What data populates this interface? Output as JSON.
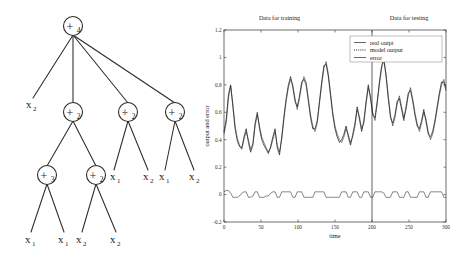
{
  "figure": {
    "caption": "",
    "panels": [
      "expression-tree",
      "output-and-error-plot"
    ]
  },
  "tree": {
    "name": "expression-tree",
    "root_label": "+",
    "nodes": [
      {
        "id": "n0",
        "op": "+",
        "subscript": "4",
        "x": 73,
        "y": 26
      },
      {
        "id": "n1",
        "op": "+",
        "subscript": "2",
        "x": 73,
        "y": 112
      },
      {
        "id": "n2",
        "op": "+",
        "subscript": "2",
        "x": 128,
        "y": 112
      },
      {
        "id": "n3",
        "op": "+",
        "subscript": "2",
        "x": 175,
        "y": 112
      },
      {
        "id": "n4",
        "op": "+",
        "subscript": "3",
        "x": 47,
        "y": 175
      },
      {
        "id": "n5",
        "op": "+",
        "subscript": "2",
        "x": 96,
        "y": 175
      }
    ],
    "leaves": [
      {
        "id": "l0",
        "var": "x",
        "subscript": "2",
        "x": 30,
        "y": 108
      },
      {
        "id": "l1",
        "var": "x",
        "subscript": "1",
        "x": 118,
        "y": 180
      },
      {
        "id": "l2",
        "var": "x",
        "subscript": "2",
        "x": 150,
        "y": 180
      },
      {
        "id": "l3",
        "var": "x",
        "subscript": "1",
        "x": 166,
        "y": 180
      },
      {
        "id": "l4",
        "var": "x",
        "subscript": "2",
        "x": 196,
        "y": 180
      },
      {
        "id": "l5",
        "var": "x",
        "subscript": "1",
        "x": 30,
        "y": 243
      },
      {
        "id": "l6",
        "var": "x",
        "subscript": "1",
        "x": 65,
        "y": 243
      },
      {
        "id": "l7",
        "var": "x",
        "subscript": "2",
        "x": 83,
        "y": 243
      },
      {
        "id": "l8",
        "var": "x",
        "subscript": "2",
        "x": 117,
        "y": 243
      }
    ],
    "edges": [
      {
        "from": "n0",
        "to": "l0"
      },
      {
        "from": "n0",
        "to": "n1"
      },
      {
        "from": "n0",
        "to": "n2"
      },
      {
        "from": "n0",
        "to": "n3"
      },
      {
        "from": "n1",
        "to": "n4"
      },
      {
        "from": "n1",
        "to": "n5"
      },
      {
        "from": "n2",
        "to": "l1"
      },
      {
        "from": "n2",
        "to": "l2"
      },
      {
        "from": "n3",
        "to": "l3"
      },
      {
        "from": "n3",
        "to": "l4"
      },
      {
        "from": "n4",
        "to": "l5"
      },
      {
        "from": "n4",
        "to": "l6"
      },
      {
        "from": "n5",
        "to": "l7"
      },
      {
        "from": "n5",
        "to": "l8"
      }
    ]
  },
  "chart_data": {
    "type": "line",
    "title": "",
    "xlabel": "time",
    "ylabel": "output and error",
    "xlim": [
      0,
      300
    ],
    "ylim": [
      -0.2,
      1.2
    ],
    "xticks": [
      0,
      50,
      100,
      150,
      200,
      250,
      300
    ],
    "xtick_labels": [
      "0",
      "50",
      "100",
      "150",
      "200",
      "250",
      "300"
    ],
    "yticks": [
      -0.2,
      0,
      0.2,
      0.4,
      0.6,
      0.8,
      1,
      1.2
    ],
    "ytick_labels": [
      "-0.2",
      "0",
      "0.2",
      "0.4",
      "0.6",
      "0.8",
      "1",
      "1.2"
    ],
    "grid": false,
    "legend_position": "top-right",
    "annotations": [
      {
        "text": "Data for training",
        "x": 75,
        "y": 1.27
      },
      {
        "text": "Data for testing",
        "x": 250,
        "y": 1.27
      }
    ],
    "split_line_x": 200,
    "legend": [
      {
        "name": "real outpt",
        "style": "solid"
      },
      {
        "name": "model output",
        "style": "dotted"
      },
      {
        "name": "error",
        "style": "solid"
      }
    ],
    "series": [
      {
        "name": "real outpt",
        "style": "solid",
        "x": [
          0,
          3,
          6,
          9,
          12,
          15,
          18,
          21,
          24,
          27,
          30,
          33,
          36,
          39,
          42,
          45,
          48,
          51,
          54,
          57,
          60,
          63,
          66,
          69,
          72,
          75,
          78,
          81,
          84,
          87,
          90,
          93,
          96,
          99,
          102,
          105,
          108,
          111,
          114,
          117,
          120,
          123,
          126,
          129,
          132,
          135,
          138,
          141,
          144,
          147,
          150,
          153,
          156,
          159,
          162,
          165,
          168,
          171,
          174,
          177,
          180,
          183,
          186,
          189,
          192,
          195,
          198,
          201,
          204,
          207,
          210,
          213,
          216,
          219,
          222,
          225,
          228,
          231,
          234,
          237,
          240,
          243,
          246,
          249,
          252,
          255,
          258,
          261,
          264,
          267,
          270,
          273,
          276,
          279,
          282,
          285,
          288,
          291,
          294,
          297,
          300
        ],
        "values": [
          0.44,
          0.52,
          0.7,
          0.79,
          0.66,
          0.5,
          0.41,
          0.36,
          0.33,
          0.4,
          0.46,
          0.4,
          0.33,
          0.37,
          0.5,
          0.58,
          0.5,
          0.42,
          0.38,
          0.34,
          0.31,
          0.34,
          0.4,
          0.46,
          0.36,
          0.31,
          0.4,
          0.55,
          0.68,
          0.78,
          0.84,
          0.8,
          0.7,
          0.62,
          0.7,
          0.8,
          0.86,
          0.82,
          0.7,
          0.58,
          0.5,
          0.46,
          0.52,
          0.66,
          0.8,
          0.92,
          0.97,
          0.88,
          0.74,
          0.6,
          0.5,
          0.44,
          0.4,
          0.38,
          0.42,
          0.48,
          0.44,
          0.38,
          0.42,
          0.5,
          0.62,
          0.57,
          0.48,
          0.52,
          0.66,
          0.78,
          0.72,
          0.6,
          0.54,
          0.66,
          0.8,
          0.92,
          0.98,
          0.88,
          0.72,
          0.58,
          0.5,
          0.56,
          0.66,
          0.72,
          0.64,
          0.56,
          0.62,
          0.72,
          0.78,
          0.7,
          0.6,
          0.52,
          0.46,
          0.52,
          0.6,
          0.55,
          0.46,
          0.4,
          0.44,
          0.52,
          0.62,
          0.72,
          0.8,
          0.84,
          0.78
        ]
      },
      {
        "name": "model output",
        "style": "dotted",
        "x": [
          0,
          3,
          6,
          9,
          12,
          15,
          18,
          21,
          24,
          27,
          30,
          33,
          36,
          39,
          42,
          45,
          48,
          51,
          54,
          57,
          60,
          63,
          66,
          69,
          72,
          75,
          78,
          81,
          84,
          87,
          90,
          93,
          96,
          99,
          102,
          105,
          108,
          111,
          114,
          117,
          120,
          123,
          126,
          129,
          132,
          135,
          138,
          141,
          144,
          147,
          150,
          153,
          156,
          159,
          162,
          165,
          168,
          171,
          174,
          177,
          180,
          183,
          186,
          189,
          192,
          195,
          198,
          201,
          204,
          207,
          210,
          213,
          216,
          219,
          222,
          225,
          228,
          231,
          234,
          237,
          240,
          243,
          246,
          249,
          252,
          255,
          258,
          261,
          264,
          267,
          270,
          273,
          276,
          279,
          282,
          285,
          288,
          291,
          294,
          297,
          300
        ],
        "values": [
          0.46,
          0.55,
          0.73,
          0.8,
          0.64,
          0.48,
          0.39,
          0.35,
          0.34,
          0.42,
          0.48,
          0.38,
          0.31,
          0.36,
          0.52,
          0.6,
          0.48,
          0.4,
          0.36,
          0.33,
          0.3,
          0.35,
          0.42,
          0.48,
          0.34,
          0.29,
          0.42,
          0.57,
          0.7,
          0.8,
          0.86,
          0.78,
          0.68,
          0.64,
          0.72,
          0.82,
          0.84,
          0.8,
          0.68,
          0.56,
          0.48,
          0.48,
          0.54,
          0.68,
          0.82,
          0.94,
          0.95,
          0.86,
          0.72,
          0.58,
          0.48,
          0.42,
          0.38,
          0.4,
          0.44,
          0.5,
          0.42,
          0.36,
          0.44,
          0.52,
          0.64,
          0.55,
          0.46,
          0.54,
          0.68,
          0.8,
          0.7,
          0.58,
          0.56,
          0.68,
          0.82,
          0.94,
          0.99,
          0.86,
          0.7,
          0.56,
          0.52,
          0.58,
          0.68,
          0.7,
          0.62,
          0.54,
          0.64,
          0.74,
          0.76,
          0.68,
          0.58,
          0.5,
          0.48,
          0.54,
          0.62,
          0.53,
          0.44,
          0.42,
          0.46,
          0.54,
          0.64,
          0.74,
          0.82,
          0.82,
          0.76
        ]
      },
      {
        "name": "error",
        "style": "solid",
        "x": [
          0,
          3,
          6,
          9,
          12,
          15,
          18,
          21,
          24,
          27,
          30,
          33,
          36,
          39,
          42,
          45,
          48,
          51,
          54,
          57,
          60,
          63,
          66,
          69,
          72,
          75,
          78,
          81,
          84,
          87,
          90,
          93,
          96,
          99,
          102,
          105,
          108,
          111,
          114,
          117,
          120,
          123,
          126,
          129,
          132,
          135,
          138,
          141,
          144,
          147,
          150,
          153,
          156,
          159,
          162,
          165,
          168,
          171,
          174,
          177,
          180,
          183,
          186,
          189,
          192,
          195,
          198,
          201,
          204,
          207,
          210,
          213,
          216,
          219,
          222,
          225,
          228,
          231,
          234,
          237,
          240,
          243,
          246,
          249,
          252,
          255,
          258,
          261,
          264,
          267,
          270,
          273,
          276,
          279,
          282,
          285,
          288,
          291,
          294,
          297,
          300
        ],
        "values": [
          0.02,
          0.03,
          0.03,
          0.01,
          -0.02,
          -0.02,
          -0.02,
          -0.01,
          0.01,
          0.02,
          0.02,
          -0.02,
          -0.02,
          -0.01,
          0.02,
          0.02,
          -0.02,
          -0.02,
          -0.02,
          -0.01,
          -0.01,
          0.01,
          0.02,
          0.02,
          -0.02,
          -0.02,
          0.02,
          0.02,
          0.02,
          0.02,
          0.02,
          -0.02,
          -0.02,
          0.02,
          0.02,
          0.02,
          -0.02,
          -0.02,
          -0.02,
          -0.02,
          -0.02,
          0.02,
          0.02,
          0.02,
          0.02,
          0.02,
          -0.02,
          -0.02,
          -0.02,
          -0.02,
          -0.02,
          -0.02,
          -0.02,
          0.02,
          0.02,
          0.02,
          -0.02,
          -0.02,
          0.02,
          0.02,
          0.02,
          -0.02,
          -0.02,
          0.02,
          0.02,
          0.02,
          -0.02,
          -0.02,
          0.02,
          0.02,
          0.02,
          0.02,
          0.01,
          -0.02,
          -0.02,
          -0.02,
          0.02,
          0.02,
          0.02,
          -0.02,
          -0.02,
          -0.02,
          0.02,
          0.02,
          -0.02,
          -0.02,
          -0.02,
          -0.02,
          0.02,
          0.02,
          0.02,
          -0.02,
          -0.02,
          0.02,
          0.02,
          0.02,
          0.02,
          0.02,
          0.02,
          -0.02,
          -0.02
        ]
      }
    ]
  }
}
